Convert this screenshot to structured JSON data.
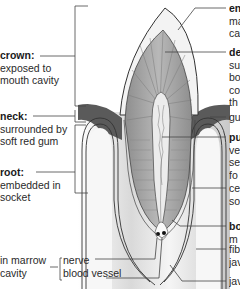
{
  "diagram": {
    "left_labels": [
      {
        "id": "crown",
        "term": "crown:",
        "desc_lines": [
          "exposed to",
          "mouth cavity"
        ]
      },
      {
        "id": "neck",
        "term": "neck:",
        "desc_lines": [
          "surrounded by",
          "soft red gum"
        ]
      },
      {
        "id": "root",
        "term": "root:",
        "desc_lines": [
          "embedded in",
          "socket"
        ]
      }
    ],
    "marrow_group": {
      "label_lines": [
        "in marrow",
        "cavity"
      ],
      "items": [
        "nerve",
        "blood vessel"
      ]
    },
    "right_labels": [
      {
        "id": "enamel",
        "term": "en",
        "desc_lines": [
          "ma",
          "ca"
        ]
      },
      {
        "id": "dentine",
        "term": "de",
        "desc_lines": [
          "su",
          "bo",
          "co",
          "th"
        ]
      },
      {
        "id": "gum",
        "term": "",
        "desc_lines": [
          "gu"
        ]
      },
      {
        "id": "pulp",
        "term": "pu",
        "desc_lines": [
          "ve",
          "se",
          "fo"
        ]
      },
      {
        "id": "cement",
        "term": "",
        "desc_lines": [
          "ce",
          "so"
        ]
      },
      {
        "id": "bone",
        "term": "bo",
        "desc_lines": [
          "m"
        ]
      },
      {
        "id": "fibres",
        "term": "",
        "desc_lines": [
          "fib",
          "jav"
        ]
      },
      {
        "id": "jawbone",
        "term": "",
        "desc_lines": [
          "jav"
        ]
      }
    ],
    "colors": {
      "enamel": "#f4f4f4",
      "dentine": "#a8a8a8",
      "pulp": "#e6e6e6",
      "gum": "#5c5c5c",
      "bone": "#d0d0d0",
      "jaw": "#f2f2f2",
      "leader": "#444444"
    }
  }
}
